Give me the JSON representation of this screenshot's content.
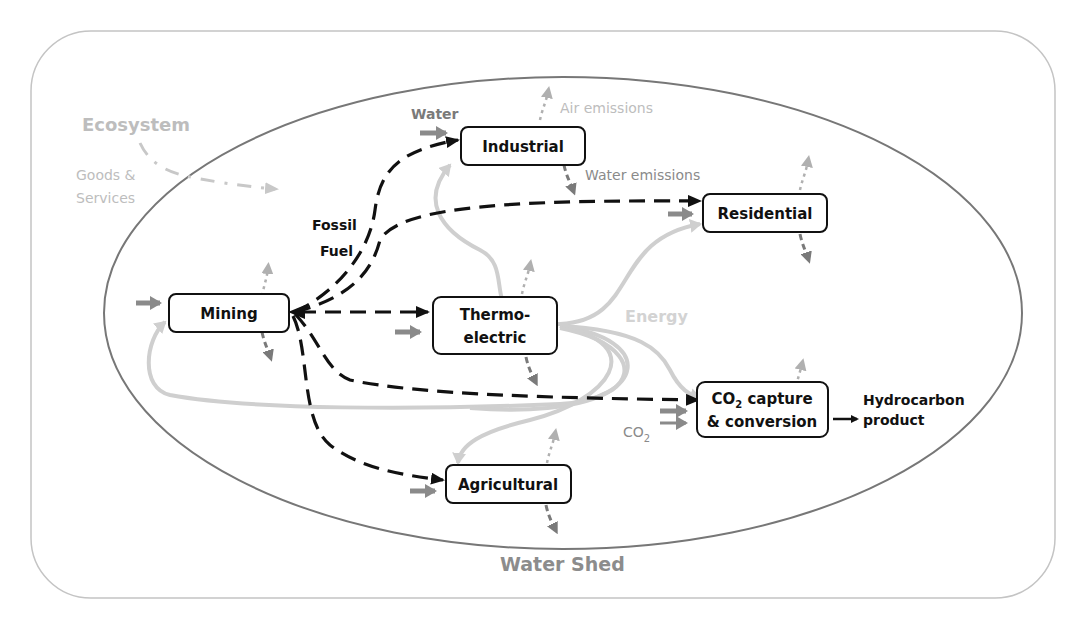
{
  "diagram": {
    "outer_label": "Ecosystem",
    "goods_services": {
      "line1": "Goods &",
      "line2": "Services"
    },
    "inner_label": "Water Shed",
    "water_label": "Water",
    "air_emissions_label": "Air emissions",
    "water_emissions_label": "Water emissions",
    "fossil_fuel": {
      "line1": "Fossil",
      "line2": "Fuel"
    },
    "energy_label": "Energy",
    "co2_input_label": "CO",
    "co2_sub": "2",
    "nodes": {
      "mining": "Mining",
      "industrial": "Industrial",
      "residential": "Residential",
      "thermoelectric": {
        "line1": "Thermo-",
        "line2": "electric"
      },
      "co2_capture": {
        "line1_pre": "CO",
        "line1_sub": "2",
        "line1_post": " capture",
        "line2": "& conversion"
      },
      "agricultural": "Agricultural"
    },
    "output": {
      "line1": "Hydrocarbon",
      "line2": "product"
    },
    "legend_colors": {
      "fossil_fuel": "#111111",
      "energy": "#cfcfcf",
      "water": "#8a8a8a",
      "air_emissions": "#b0b0b0",
      "water_emissions": "#7a7a7a",
      "ecosystem": "#bdbdbd"
    }
  }
}
